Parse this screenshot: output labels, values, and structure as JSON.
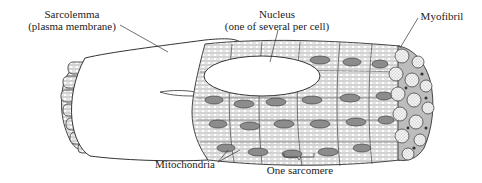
{
  "diagram": {
    "labels": {
      "sarcolemma": {
        "line1": "Sarcolemma",
        "line2": "(plasma membrane)"
      },
      "nucleus": {
        "line1": "Nucleus",
        "line2": "(one of several per cell)"
      },
      "myofibril": {
        "line1": "Myofibril"
      },
      "mitochondria": {
        "line1": "Mitochondria"
      },
      "sarcomere": {
        "line1": "One sarcomere"
      }
    },
    "colors": {
      "ink": "#222222",
      "mitochondria_fill": "#8c8c8c",
      "myofibril_fill": "#e6e6e6",
      "background": "#ffffff"
    }
  }
}
